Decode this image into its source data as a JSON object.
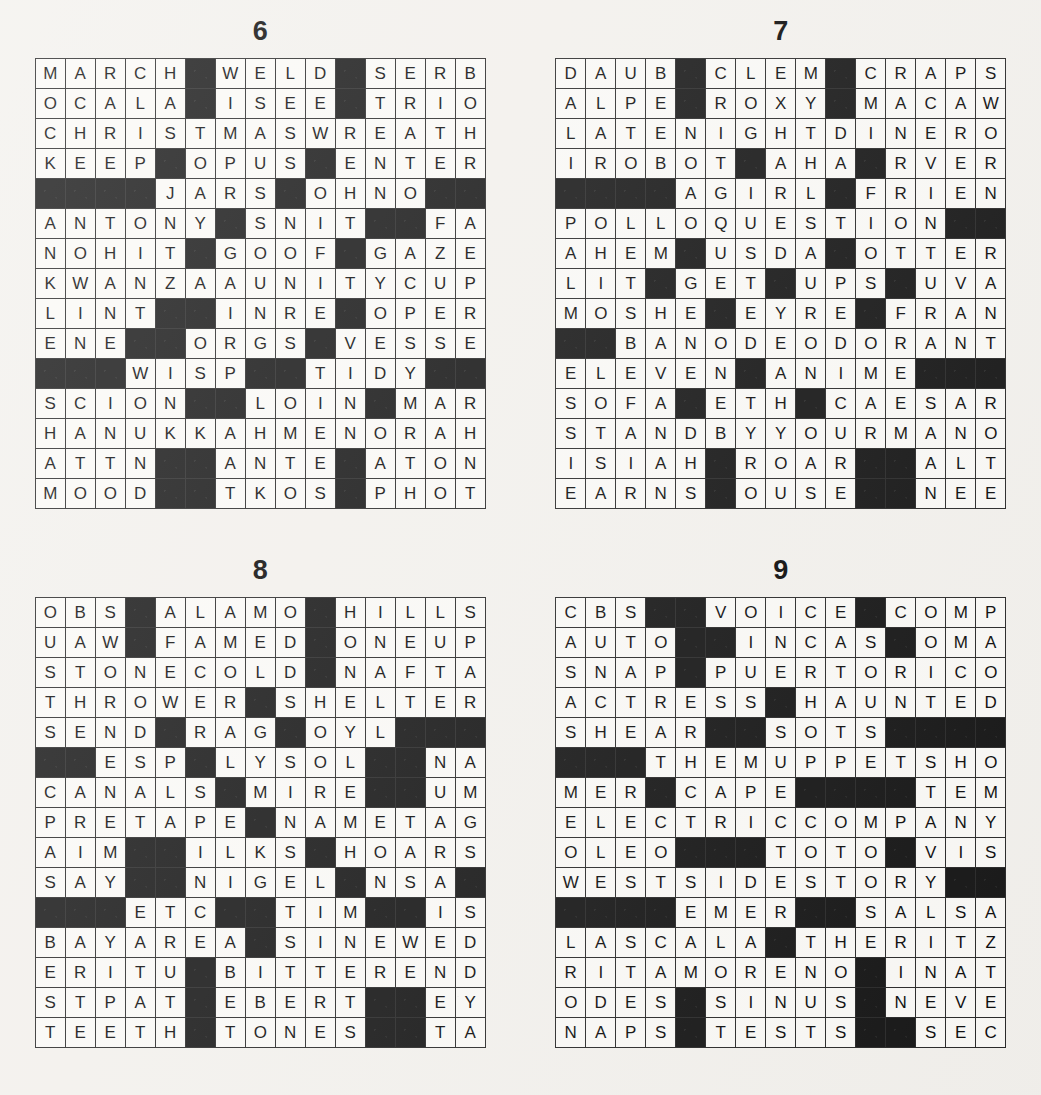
{
  "page": {
    "kind": "crossword-solution-grids",
    "grid_size": 15,
    "block_char": "#"
  },
  "puzzles": [
    {
      "number": "6",
      "rows": [
        "MARCH#WELD#SERB",
        "OCALA#ISEE#TRIO",
        "CHRISTMASWREATH",
        "KEEP#OPUS#ENTER",
        "####JARS#OHNO##",
        "ANTONY#SNIT##FAN",
        "NOHIT#GOOF#GAZE",
        "KWANZAAUNITYCUP",
        "LINT##INRE#OPERA",
        "ENE##ORGS#VESSEL",
        "###WISP##TIDY###",
        "SCION##LOIN#MART",
        "HANUKKAHMENORAH",
        "ATTN##ANTE#ATONE",
        "MOOD##TKOS#PHOTO"
      ]
    },
    {
      "number": "7",
      "rows": [
        "DAUB#CLEM#CRAPS",
        "ALPE#ROXY#MACAW",
        "LATENIGHTDINERO",
        "IROBOT#AHA#RVER",
        "####AGIRL#FRIEND",
        "POLLOQUESTION##",
        "AHEM#USDA#OTTER",
        "LIT#GET#UPS#UVA",
        "MOSHE#EYRE#FRAN",
        "##BANODEODORANT",
        "ELEVEN#ANIME###",
        "SOFA#ETH#CAESAR",
        "STANDBYYOURMANO",
        "ISIAH#ROAR##ALTO",
        "EARNS#OUSE##NEED"
      ]
    },
    {
      "number": "8",
      "rows": [
        "OBS#ALAMO#HILLS",
        "UAW#FAMED#ONEUP",
        "STONECOLD#NAFTA",
        "THROWER#SHELTER",
        "SEND#RAG#OYL###",
        "##ESP#LYSOL##NAW",
        "CANALS#MIRE##UMA",
        "PRETAPE#NAMETAG",
        "AIM##ILKS#HOARSE",
        "SAY##NIGEL#NSA##",
        "###ETC##TIM##ISLA",
        "BAYAREA#SINEWED",
        "ERITU#BITTEREND",
        "STPAT#EBERT##EYE",
        "TEETH#TONES##TAR"
      ]
    },
    {
      "number": "9",
      "rows": [
        "CBS##VOICE#COMP",
        "AUTO##INCAS#OMAR",
        "SNAP#PUERTORICO",
        "ACTRESS#HAUNTED",
        "SHEAR##SOTS####",
        "###THEMUPPETSHOW",
        "MER#CAPE####TEMA",
        "ELECTRICCOMPANY",
        "OLEO###TOTO#VIS",
        "WESTSIDESTORY##",
        "####EMER##SALSA",
        "LASCALA#THERITZ",
        "RITAMORENO#INAT",
        "ODES#SINUS#NEVE",
        "NAPS#TESTS##SEC"
      ]
    }
  ]
}
